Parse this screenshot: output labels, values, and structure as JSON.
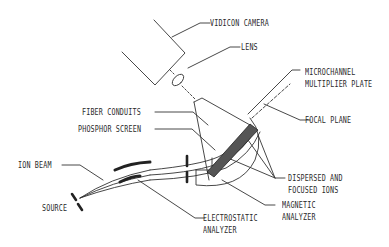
{
  "diagram": {
    "type": "schematic",
    "labels": {
      "vidicon_camera": "VIDICON CAMERA",
      "lens": "LENS",
      "microchannel_line1": "MICROCHANNEL",
      "microchannel_line2": "MULTIPLIER PLATE",
      "focal_plane": "FOCAL PLANE",
      "fiber_conduits": "FIBER CONDUITS",
      "phosphor_screen": "PHOSPHOR SCREEN",
      "ion_beam": "ION BEAM",
      "source": "SOURCE",
      "dispersed_line1": "DISPERSED AND",
      "dispersed_line2": "FOCUSED IONS",
      "magnetic_line1": "MAGNETIC",
      "magnetic_line2": "ANALYZER",
      "electrostatic_line1": "ELECTROSTATIC",
      "electrostatic_line2": "ANALYZER"
    },
    "colors": {
      "line": "#333333",
      "background": "#ffffff"
    }
  }
}
